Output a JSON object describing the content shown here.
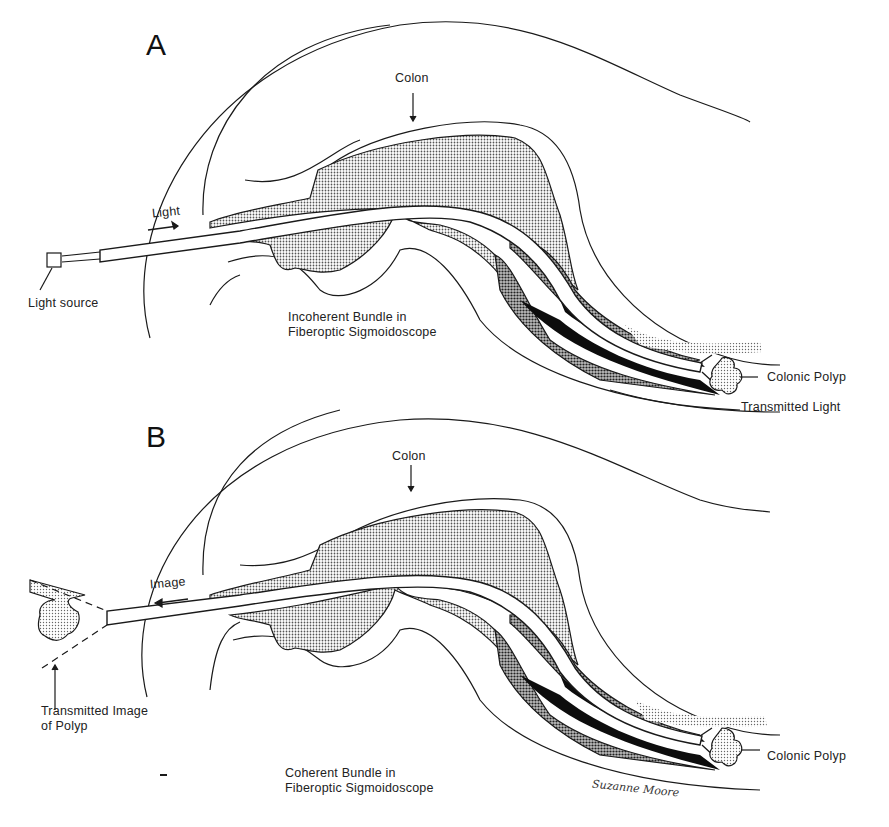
{
  "figure": {
    "panels": [
      {
        "letter": "A",
        "labels": {
          "colon": "Colon",
          "direction": "Light",
          "source": "Light source",
          "bundle_line1": "Incoherent Bundle in",
          "bundle_line2": "Fiberoptic Sigmoidoscope",
          "polyp": "Colonic Polyp",
          "transmitted": "Transmitted Light"
        }
      },
      {
        "letter": "B",
        "labels": {
          "colon": "Colon",
          "direction": "Image",
          "transmitted_line1": "Transmitted Image",
          "transmitted_line2": "of Polyp",
          "bundle_line1": "Coherent Bundle in",
          "bundle_line2": "Fiberoptic Sigmoidoscope",
          "polyp": "Colonic Polyp"
        }
      }
    ],
    "signature": "Suzanne Moore",
    "colors": {
      "line": "#1a1a1a",
      "stipple_light": "#c8c8c8",
      "stipple_mid": "#8a8a8a",
      "dark": "#0d0d0d",
      "background": "#ffffff"
    }
  }
}
